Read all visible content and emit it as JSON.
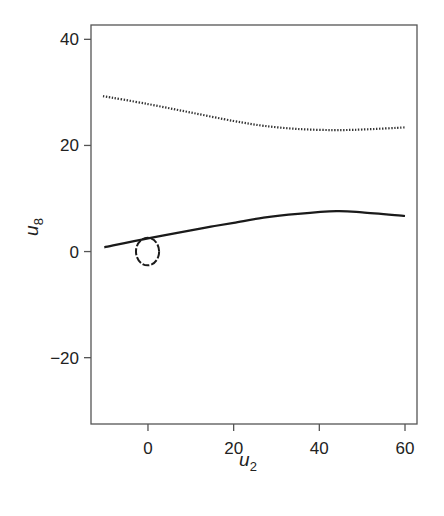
{
  "chart_data": {
    "type": "line",
    "title": "",
    "xlabel": "u2",
    "ylabel": "u8",
    "xlabel_parts": {
      "base": "u",
      "sub": "2"
    },
    "ylabel_parts": {
      "base": "u",
      "sub": "8"
    },
    "xlim": [
      -13.3,
      62.8
    ],
    "ylim": [
      -32.5,
      42.7
    ],
    "xticks": [
      0,
      20,
      40,
      60
    ],
    "yticks": [
      40,
      20,
      0,
      -20
    ],
    "xtick_labels": [
      "0",
      "20",
      "40",
      "60"
    ],
    "ytick_labels": [
      "40",
      "20",
      "0",
      "−20"
    ],
    "grid": false,
    "legend": null,
    "series": [
      {
        "name": "dotted-curve",
        "style": "dotted",
        "x": [
          -10.5,
          0,
          10,
          20,
          27,
          35,
          43.3,
          50,
          60
        ],
        "y": [
          29.3,
          27.8,
          26.2,
          24.6,
          23.7,
          23.1,
          22.9,
          23.0,
          23.4
        ]
      },
      {
        "name": "solid-curve",
        "style": "solid",
        "x": [
          -10.2,
          0,
          10,
          14.7,
          20,
          27,
          35,
          44,
          50,
          60
        ],
        "y": [
          0.8,
          2.5,
          4.0,
          4.7,
          5.4,
          6.4,
          7.1,
          7.6,
          7.4,
          6.7
        ]
      },
      {
        "name": "dashed-loop",
        "style": "dashed",
        "shape": "ellipse",
        "center": [
          -0.1,
          0.0
        ],
        "radius_x": 2.7,
        "radius_y": 2.6
      }
    ]
  },
  "colors": {
    "line": "#1a1a1a",
    "frame": "#555555",
    "text": "#222222"
  }
}
